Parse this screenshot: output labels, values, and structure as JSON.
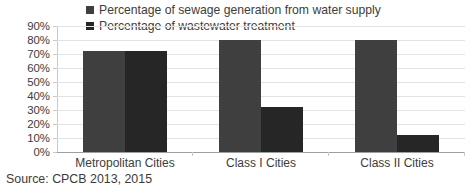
{
  "chart_data": {
    "type": "bar",
    "title": "",
    "xlabel": "",
    "ylabel": "",
    "ylim": [
      0,
      90
    ],
    "ytick_step": 10,
    "grid": true,
    "legend_position": "top",
    "categories": [
      "Metropolitan Cities",
      "Class I Cities",
      "Class II Cities"
    ],
    "ytick_labels": [
      "90%",
      "80%",
      "70%",
      "60%",
      "50%",
      "40%",
      "30%",
      "20%",
      "10%",
      "0%"
    ],
    "series": [
      {
        "name": "Percentage of sewage generation from water supply",
        "color": "#3f3f3f",
        "values": [
          72,
          80,
          80
        ]
      },
      {
        "name": "Percentage of wastewater treatment",
        "color": "#262626",
        "values": [
          72,
          32,
          12
        ]
      }
    ],
    "source_note": "Source: CPCB 2013, 2015"
  },
  "legend": {
    "items": [
      {
        "label": "Percentage of sewage generation from water supply",
        "marker": "legend-square-marker"
      },
      {
        "label": "Percentage of wastewater treatment",
        "marker": "legend-square-marker"
      }
    ]
  },
  "caption": {
    "source": "Source: CPCB 2013, 2015"
  }
}
